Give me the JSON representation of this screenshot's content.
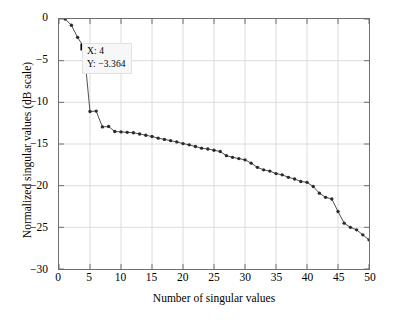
{
  "chart_data": {
    "type": "line",
    "title": "",
    "xlabel": "Number of singular values",
    "ylabel": "Normalized singular values (dB scale)",
    "xlim": [
      0,
      50
    ],
    "ylim": [
      -30,
      0
    ],
    "xticks": [
      0,
      5,
      10,
      15,
      20,
      25,
      30,
      35,
      40,
      45,
      50
    ],
    "yticks": [
      0,
      -5,
      -10,
      -15,
      -20,
      -25,
      -30
    ],
    "xticklabels": [
      "0",
      "5",
      "10",
      "15",
      "20",
      "25",
      "30",
      "35",
      "40",
      "45",
      "50"
    ],
    "yticklabels": [
      "0",
      "−5",
      "−10",
      "−15",
      "−20",
      "−25",
      "−30"
    ],
    "grid": true,
    "legend": null,
    "marker": "dot",
    "line_color": "#3a3a3a",
    "marker_color": "#2b2b2b",
    "grid_color": "#dcdcdc",
    "axis_color": "#6e6e6e",
    "x": [
      1,
      2,
      3,
      4,
      5,
      6,
      7,
      8,
      9,
      10,
      11,
      12,
      13,
      14,
      15,
      16,
      17,
      18,
      19,
      20,
      21,
      22,
      23,
      24,
      25,
      26,
      27,
      28,
      29,
      30,
      31,
      32,
      33,
      34,
      35,
      36,
      37,
      38,
      39,
      40,
      41,
      42,
      43,
      44,
      45,
      46,
      47,
      48,
      49,
      50
    ],
    "values": [
      0,
      -0.75,
      -2.2,
      -3.364,
      -11.1,
      -11.05,
      -12.95,
      -12.9,
      -13.5,
      -13.55,
      -13.6,
      -13.65,
      -13.8,
      -13.95,
      -14.1,
      -14.3,
      -14.45,
      -14.6,
      -14.75,
      -14.95,
      -15.1,
      -15.3,
      -15.5,
      -15.6,
      -15.75,
      -15.9,
      -16.4,
      -16.6,
      -16.75,
      -16.9,
      -17.3,
      -17.8,
      -18.1,
      -18.25,
      -18.55,
      -18.7,
      -19.0,
      -19.2,
      -19.5,
      -19.6,
      -20.1,
      -20.9,
      -21.4,
      -21.6,
      -23.1,
      -24.5,
      -25.0,
      -25.3,
      -25.9,
      -26.5
    ],
    "annotation": {
      "name": "data-tip",
      "x_label": "X: 4",
      "y_label": "Y: −3.364",
      "point_x": 4,
      "point_y": -3.364,
      "marker": "filled-square"
    }
  }
}
